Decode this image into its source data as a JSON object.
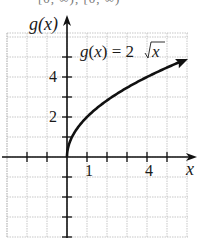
{
  "chart_data": {
    "type": "line",
    "title": "",
    "top_clipped_text": "[0, ∞), [0, ∞)",
    "function_label": "g(x) = 2√x",
    "function_label_parts": {
      "lhs": "g(x) = 2",
      "radicand": "x"
    },
    "xlabel": "x",
    "ylabel": "g(x)",
    "x_tick_labels": [
      {
        "value": 1,
        "label": "1"
      },
      {
        "value": 4,
        "label": "4"
      }
    ],
    "y_tick_labels": [
      {
        "value": 2,
        "label": "2"
      },
      {
        "value": 4,
        "label": "4"
      }
    ],
    "xlim": [
      -3,
      6
    ],
    "ylim": [
      -4,
      6
    ],
    "grid": true,
    "series": [
      {
        "name": "g(x) = 2√x",
        "x": [
          0,
          0.25,
          0.5,
          1,
          2,
          3,
          4,
          5,
          5.95
        ],
        "y": [
          0,
          1,
          1.41,
          2,
          2.83,
          3.46,
          4,
          4.47,
          4.88
        ],
        "arrow_end": true
      }
    ]
  }
}
